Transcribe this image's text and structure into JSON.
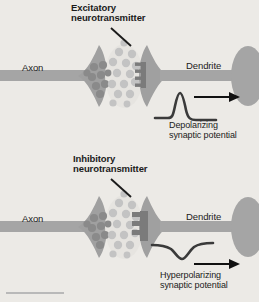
{
  "figure": {
    "background_color": "#eceae6",
    "page_color": "#ffffff",
    "ink_color": "#1b1b1b"
  },
  "colors": {
    "neuron_fill": "#a5a5a5",
    "terminal_fill": "#a0a0a0",
    "vesicle_inside": "#8a8a8a",
    "vesicle_cleft": "#c3c3c3",
    "cleft_fill": "#e2e0dc",
    "receptor": "#7b7b7b",
    "trace": "#3a3a3a",
    "arrow": "#111111",
    "leader": "#1b1b1b",
    "rule": "#b9b9b9"
  },
  "panels": [
    {
      "id": "excitatory",
      "neurotransmitter_label": "Excitatory\nneurotransmitter",
      "axon_label": "Axon",
      "dendrite_label": "Dendrite",
      "potential_label": "Depolarizing\nsynaptic potential",
      "trace_type": "upward-peak",
      "receptor_count": 3,
      "vesicle_inside_count": 9,
      "vesicle_cleft_count": 15
    },
    {
      "id": "inhibitory",
      "neurotransmitter_label": "Inhibitory\nneurotransmitter",
      "axon_label": "Axon",
      "dendrite_label": "Dendrite",
      "potential_label": "Hyperpolarizing\nsynaptic potential",
      "trace_type": "downward-dip",
      "receptor_count": 3,
      "vesicle_inside_count": 9,
      "vesicle_cleft_count": 15
    }
  ]
}
